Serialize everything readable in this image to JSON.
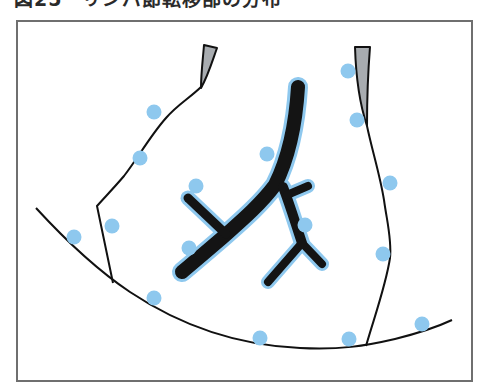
{
  "figure": {
    "title": "図25　リンパ節転移部の分布"
  },
  "colors": {
    "frame": "#6f6f6f",
    "line": "#111111",
    "tree": "#141414",
    "tree_halo": "#8ec8ee",
    "node": "#8ec8ee",
    "wedge_fill": "#a8acb0"
  },
  "nodes": [
    {
      "x": 74,
      "y": 237
    },
    {
      "x": 154,
      "y": 112
    },
    {
      "x": 140,
      "y": 158
    },
    {
      "x": 112,
      "y": 226
    },
    {
      "x": 196,
      "y": 186
    },
    {
      "x": 189,
      "y": 248
    },
    {
      "x": 154,
      "y": 298
    },
    {
      "x": 267,
      "y": 154
    },
    {
      "x": 348,
      "y": 71
    },
    {
      "x": 357,
      "y": 120
    },
    {
      "x": 390,
      "y": 183
    },
    {
      "x": 305,
      "y": 225
    },
    {
      "x": 383,
      "y": 254
    },
    {
      "x": 260,
      "y": 338
    },
    {
      "x": 349,
      "y": 339
    },
    {
      "x": 422,
      "y": 324
    }
  ]
}
